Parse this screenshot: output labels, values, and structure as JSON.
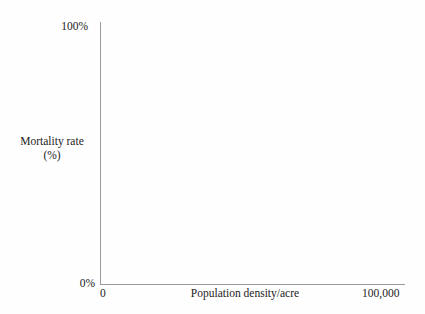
{
  "figure": {
    "background_color": "#fefefe",
    "axis_color": "#9a9a9a",
    "text_color": "#232323"
  },
  "chart_data": {
    "type": "scatter",
    "title": "",
    "subtitle": "",
    "xlabel": "Population density/acre",
    "ylabel": "Mortality rate (%)",
    "ylabel_lines": [
      "Mortality rate",
      "(%)"
    ],
    "x": [],
    "y": [],
    "series": [],
    "xlim": [
      0,
      100000
    ],
    "ylim": [
      0,
      100
    ],
    "xticks": [
      0,
      100000
    ],
    "yticks": [
      0,
      100
    ],
    "xticklabels": [
      "0",
      "100,000"
    ],
    "yticklabels": [
      "0%",
      "100%"
    ],
    "grid": false,
    "legend": null,
    "annotations": [],
    "note": "Empty axes template: no data points are plotted."
  },
  "axes": {
    "y_top_label": "100%",
    "y_bottom_label": "0%",
    "x_left_label": "0",
    "x_right_label": "100,000",
    "y_title_line1": "Mortality rate",
    "y_title_line2": "(%)",
    "x_title": "Population density/acre"
  }
}
